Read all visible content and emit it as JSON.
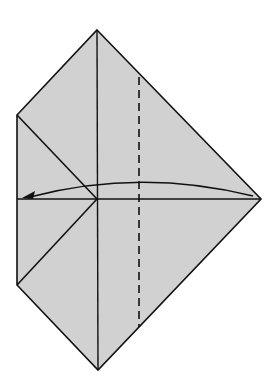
{
  "diagram": {
    "type": "origami-fold-step",
    "paper_fill": "#d1d1d1",
    "line_color": "#111111",
    "background": "#ffffff",
    "outline": [
      [
        97,
        30
      ],
      [
        261,
        199
      ],
      [
        98,
        370
      ],
      [
        17,
        285
      ],
      [
        17,
        115
      ]
    ],
    "creases": [
      {
        "name": "vertical-center-line",
        "from": [
          97,
          30
        ],
        "to": [
          98,
          370
        ],
        "style": "solid"
      },
      {
        "name": "horizontal-center-line",
        "from": [
          17,
          199
        ],
        "to": [
          261,
          199
        ],
        "style": "solid"
      },
      {
        "name": "upper-left-flap-edge",
        "from": [
          17,
          115
        ],
        "to": [
          97,
          199
        ],
        "style": "solid"
      },
      {
        "name": "lower-left-flap-edge",
        "from": [
          97,
          199
        ],
        "to": [
          17,
          285
        ],
        "style": "solid"
      },
      {
        "name": "valley-fold-line",
        "from": [
          139,
          77
        ],
        "to": [
          139,
          327
        ],
        "style": "dashed"
      }
    ],
    "arrow": {
      "name": "fold-direction-arrow",
      "start": [
        253,
        196
      ],
      "control": [
        140,
        170
      ],
      "end": [
        24,
        198
      ],
      "meaning": "fold right corner over to the left along the dashed line"
    }
  }
}
